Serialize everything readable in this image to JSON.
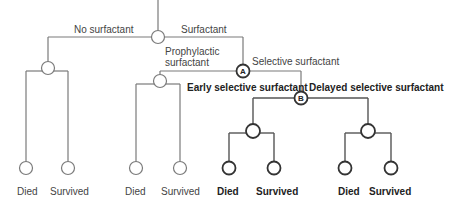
{
  "diagram": {
    "type": "decision-tree",
    "branches": {
      "no_surfactant": "No surfactant",
      "surfactant": "Surfactant",
      "prophylactic_line1": "Prophylactic",
      "prophylactic_line2": "surfactant",
      "selective": "Selective surfactant",
      "early_selective": "Early selective surfactant",
      "delayed_selective": "Delayed selective surfactant"
    },
    "node_labels": {
      "a": "A",
      "b": "B"
    },
    "outcomes": [
      {
        "label": "Died",
        "bold": false
      },
      {
        "label": "Survived",
        "bold": false
      },
      {
        "label": "Died",
        "bold": false
      },
      {
        "label": "Survived",
        "bold": false
      },
      {
        "label": "Died",
        "bold": true
      },
      {
        "label": "Survived",
        "bold": true
      },
      {
        "label": "Died",
        "bold": true
      },
      {
        "label": "Survived",
        "bold": true
      }
    ]
  }
}
